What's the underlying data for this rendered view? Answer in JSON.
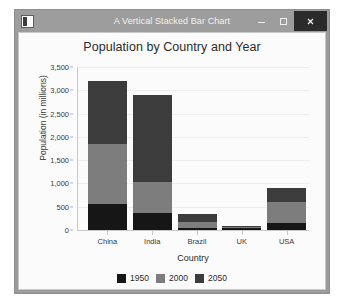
{
  "window": {
    "title": "A Vertical Stacked Bar Chart",
    "icon_name": "application-icon",
    "controls": {
      "minimize_label": "Minimize",
      "maximize_label": "Maximize",
      "close_label": "Close"
    }
  },
  "chart_data": {
    "type": "bar",
    "stacked": true,
    "orientation": "vertical",
    "title": "Population by Country and Year",
    "xlabel": "Country",
    "ylabel": "Population (in millions)",
    "categories": [
      "China",
      "India",
      "Brazil",
      "UK",
      "USA"
    ],
    "series": [
      {
        "name": "1950",
        "color": "#161616",
        "values": [
          554,
          376,
          54,
          50,
          158
        ]
      },
      {
        "name": "2000",
        "color": "#7d7d7d",
        "values": [
          1290,
          660,
          122,
          9,
          440
        ]
      },
      {
        "name": "2050",
        "color": "#3c3c3c",
        "values": [
          1356,
          1864,
          172,
          16,
          295
        ]
      }
    ],
    "totals": [
      3200,
      2900,
      348,
      75,
      893
    ],
    "ylim": [
      0,
      3500
    ],
    "yticks": [
      0,
      500,
      1000,
      1500,
      2000,
      2500,
      3000,
      3500
    ],
    "ytick_labels": [
      "0",
      "500",
      "1,000",
      "1,500",
      "2,000",
      "2,500",
      "3,000",
      "3,500"
    ],
    "grid": true,
    "legend_position": "bottom",
    "legend_entries": [
      "1950",
      "2000",
      "2050"
    ]
  },
  "colors": {
    "plot_background": "#fbfbfb",
    "window_frame": "#9b9b9b",
    "titlebar": "#9d9d9d",
    "close_button": "#2b2b2b",
    "gridline": "#ededed",
    "axis": "#c9c9c9"
  }
}
